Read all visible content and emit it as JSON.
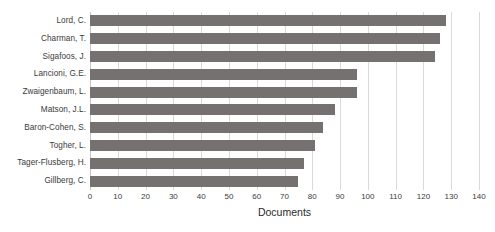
{
  "chart_data": {
    "type": "bar",
    "orientation": "horizontal",
    "title": "",
    "xlabel": "Documents",
    "ylabel": "",
    "xlim": [
      0,
      140
    ],
    "xtick_step": 10,
    "xticks": [
      "0",
      "10",
      "20",
      "30",
      "40",
      "50",
      "60",
      "70",
      "80",
      "90",
      "100",
      "110",
      "120",
      "130",
      "140"
    ],
    "grid": true,
    "grid_axis": "x",
    "legend": null,
    "bar_color": "#767171",
    "categories": [
      "Lord, C.",
      "Charman, T.",
      "Sigafoos, J.",
      "Lancioni, G.E.",
      "Zwaigenbaum, L.",
      "Matson, J.L.",
      "Baron-Cohen, S.",
      "Togher, L.",
      "Tager-Flusberg, H.",
      "Gillberg, C."
    ],
    "values": [
      128,
      126,
      124,
      96,
      96,
      88,
      84,
      81,
      77,
      75
    ]
  }
}
